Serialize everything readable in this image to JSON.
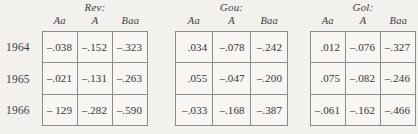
{
  "row_labels": [
    "1964",
    "1965",
    "1966"
  ],
  "tables": [
    {
      "title": "Rev:",
      "columns": [
        "Aa",
        "A",
        "Baa"
      ],
      "left": 42,
      "width": 106,
      "rows": [
        [
          "–.038",
          "–.152",
          "–.323"
        ],
        [
          "–.021",
          "–.131",
          "–.263"
        ],
        [
          "– 129",
          "–.282",
          "–.590"
        ]
      ]
    },
    {
      "title": "Gou:",
      "columns": [
        "Aa",
        "A",
        "Baa"
      ],
      "left": 175,
      "width": 113,
      "rows": [
        [
          ".034",
          "–.078",
          "–.242"
        ],
        [
          ".055",
          "–.047",
          "–.200"
        ],
        [
          "–.033",
          "–.168",
          "–.387"
        ]
      ]
    },
    {
      "title": "Gol:",
      "columns": [
        "Aa",
        "A",
        "Baa"
      ],
      "left": 310,
      "width": 106,
      "rows": [
        [
          ".012",
          "–.076",
          "–.327"
        ],
        [
          ".075",
          "–.082",
          "–.246"
        ],
        [
          "–.061",
          "–.162",
          "–.466"
        ]
      ]
    }
  ]
}
